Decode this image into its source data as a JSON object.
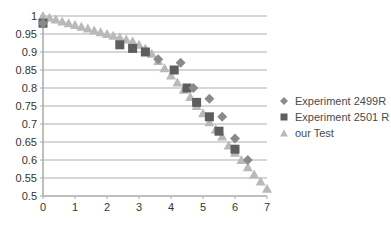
{
  "chart_data": {
    "type": "scatter",
    "title": "",
    "xlabel": "",
    "ylabel": "",
    "xlim": [
      0,
      7
    ],
    "ylim": [
      0.5,
      1
    ],
    "x_ticks": [
      "0",
      "1",
      "2",
      "3",
      "4",
      "5",
      "6",
      "7"
    ],
    "y_ticks": [
      "0.5",
      "0.55",
      "0.6",
      "0.65",
      "0.7",
      "0.75",
      "0.8",
      "0.85",
      "0.9",
      "0.95",
      "1"
    ],
    "grid": "horizontal",
    "legend_position": "right",
    "series": [
      {
        "name": "Experiment 2499R",
        "marker": "diamond",
        "color": "#8a8a8a",
        "points": [
          [
            0,
            0.98
          ],
          [
            3.6,
            0.88
          ],
          [
            4.3,
            0.87
          ],
          [
            4.7,
            0.8
          ],
          [
            5.2,
            0.77
          ],
          [
            5.6,
            0.72
          ],
          [
            6.0,
            0.66
          ],
          [
            6.4,
            0.6
          ]
        ]
      },
      {
        "name": "Experiment 2501 R",
        "marker": "square",
        "color": "#5e5e5e",
        "points": [
          [
            0,
            0.98
          ],
          [
            2.4,
            0.92
          ],
          [
            2.8,
            0.91
          ],
          [
            3.2,
            0.9
          ],
          [
            4.1,
            0.85
          ],
          [
            4.5,
            0.8
          ],
          [
            4.8,
            0.76
          ],
          [
            5.2,
            0.72
          ],
          [
            5.5,
            0.68
          ],
          [
            6.0,
            0.63
          ]
        ]
      },
      {
        "name": "our Test",
        "marker": "triangle",
        "color": "#b9b9b9",
        "points": [
          [
            0,
            1.0
          ],
          [
            0.2,
            0.995
          ],
          [
            0.4,
            0.99
          ],
          [
            0.6,
            0.985
          ],
          [
            0.8,
            0.98
          ],
          [
            1.0,
            0.975
          ],
          [
            1.2,
            0.97
          ],
          [
            1.4,
            0.965
          ],
          [
            1.6,
            0.96
          ],
          [
            1.8,
            0.955
          ],
          [
            2.0,
            0.95
          ],
          [
            2.2,
            0.945
          ],
          [
            2.4,
            0.94
          ],
          [
            2.6,
            0.935
          ],
          [
            2.8,
            0.93
          ],
          [
            3.0,
            0.92
          ],
          [
            3.2,
            0.91
          ],
          [
            3.4,
            0.895
          ],
          [
            3.6,
            0.875
          ],
          [
            3.8,
            0.855
          ],
          [
            4.0,
            0.835
          ],
          [
            4.2,
            0.815
          ],
          [
            4.4,
            0.795
          ],
          [
            4.6,
            0.775
          ],
          [
            4.8,
            0.75
          ],
          [
            5.0,
            0.73
          ],
          [
            5.2,
            0.705
          ],
          [
            5.4,
            0.685
          ],
          [
            5.6,
            0.665
          ],
          [
            5.8,
            0.64
          ],
          [
            6.0,
            0.62
          ],
          [
            6.2,
            0.6
          ],
          [
            6.4,
            0.58
          ],
          [
            6.6,
            0.56
          ],
          [
            6.8,
            0.54
          ],
          [
            7.0,
            0.52
          ]
        ]
      }
    ]
  },
  "legend": {
    "items": [
      {
        "label": "Experiment 2499R",
        "marker": "diamond-icon"
      },
      {
        "label": "Experiment 2501 R",
        "marker": "square-icon"
      },
      {
        "label": "our Test",
        "marker": "triangle-icon"
      }
    ]
  }
}
